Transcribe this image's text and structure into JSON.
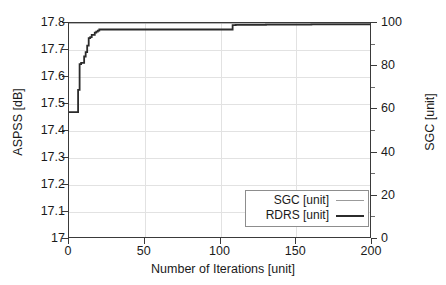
{
  "chart_data": {
    "type": "line",
    "title": "",
    "subtitle": "",
    "xlabel": "Number of Iterations [unit]",
    "ylabel": "ASPSS [dB]",
    "y2label": "SGC [unit]",
    "xlim": [
      0,
      200
    ],
    "ylim": [
      17,
      17.8
    ],
    "y2lim": [
      0,
      100
    ],
    "xticks": [
      0,
      50,
      100,
      150,
      200
    ],
    "xticklabels": [
      "0",
      "50",
      "100",
      "150",
      "200"
    ],
    "yticks": [
      17,
      17.1,
      17.2,
      17.3,
      17.4,
      17.5,
      17.6,
      17.7,
      17.8
    ],
    "yticklabels": [
      "17",
      "17.1",
      "17.2",
      "17.3",
      "17.4",
      "17.5",
      "17.6",
      "17.7",
      "17.8"
    ],
    "y2ticks": [
      0,
      20,
      40,
      60,
      80,
      100
    ],
    "y2ticklabels": [
      "0",
      "20",
      "40",
      "60",
      "80",
      "100"
    ],
    "y2minorticks": [
      10,
      30,
      50,
      70,
      90
    ],
    "grid": true,
    "grid_color": "#e2e2e2",
    "legend_position": "lower right",
    "series": [
      {
        "name": "SGC [unit]",
        "axis": "right",
        "color": "#9b9b9b",
        "width": 1.4,
        "drawstyle": "steps-post",
        "x": [
          0,
          2,
          4,
          6,
          8,
          10,
          12,
          14,
          16,
          18,
          20,
          25,
          30,
          40,
          50,
          60,
          70,
          80,
          90,
          100,
          108,
          110,
          120,
          140,
          160,
          180,
          200
        ],
        "y": [
          100,
          100,
          100,
          100,
          100,
          100,
          100,
          100,
          100,
          100,
          100,
          100,
          100,
          100,
          100,
          100,
          100,
          100,
          100,
          100,
          100,
          100,
          100,
          100,
          100,
          100,
          100
        ]
      },
      {
        "name": "RDRS [unit]",
        "axis": "left",
        "color": "#2b2b2b",
        "width": 1.8,
        "drawstyle": "steps-post",
        "x": [
          0,
          1,
          2,
          3,
          4,
          5,
          6,
          7,
          8,
          9,
          10,
          11,
          12,
          13,
          14,
          15,
          16,
          17,
          18,
          19,
          20,
          22,
          25,
          30,
          40,
          50,
          60,
          70,
          80,
          90,
          100,
          107,
          108,
          110,
          120,
          130,
          140,
          150,
          160,
          170,
          180,
          190,
          200
        ],
        "y": [
          17.47,
          17.47,
          17.47,
          17.47,
          17.47,
          17.47,
          17.552,
          17.648,
          17.652,
          17.652,
          17.676,
          17.692,
          17.716,
          17.744,
          17.748,
          17.756,
          17.756,
          17.764,
          17.768,
          17.772,
          17.776,
          17.776,
          17.776,
          17.776,
          17.776,
          17.776,
          17.776,
          17.776,
          17.776,
          17.776,
          17.776,
          17.776,
          17.792,
          17.793,
          17.793,
          17.794,
          17.794,
          17.794,
          17.795,
          17.795,
          17.795,
          17.795,
          17.796
        ]
      }
    ],
    "legend_entries": [
      {
        "label": "SGC [unit]",
        "color": "#9b9b9b",
        "style": "thin-line"
      },
      {
        "label": "RDRS [unit]",
        "color": "#2b2b2b",
        "style": "thick-line"
      }
    ],
    "colors": {
      "axis": "#3a3a3a",
      "grid": "#e2e2e2",
      "background": "#ffffff",
      "sgc": "#9b9b9b",
      "rdrs": "#2b2b2b",
      "legend_border": "#8d8d8d"
    }
  }
}
